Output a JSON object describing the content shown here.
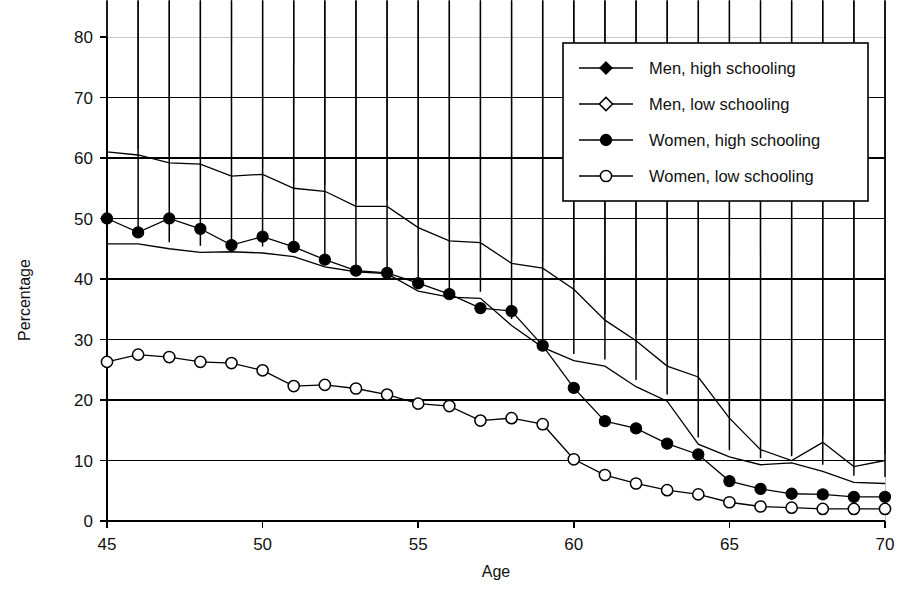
{
  "chart_data": {
    "type": "line",
    "title": "",
    "xlabel": "Age",
    "ylabel": "Percentage",
    "xlim": [
      45,
      70
    ],
    "ylim": [
      0,
      80
    ],
    "xticks": [
      45,
      50,
      55,
      60,
      65,
      70
    ],
    "yticks": [
      0,
      10,
      20,
      30,
      40,
      50,
      60,
      70,
      80
    ],
    "grid": "horizontal",
    "legend_position": "top-right",
    "x": [
      45,
      46,
      47,
      48,
      49,
      50,
      51,
      52,
      53,
      54,
      55,
      56,
      57,
      58,
      59,
      60,
      61,
      62,
      63,
      64,
      65,
      66,
      67,
      68,
      69,
      70
    ],
    "series": [
      {
        "name": "Men, high schooling",
        "marker": "filled-diamond",
        "values": [
          61,
          60.5,
          59.2,
          59,
          57,
          57.3,
          55,
          54.5,
          52,
          52,
          48.5,
          46.3,
          46,
          42.6,
          41.8,
          38.3,
          33.2,
          29.8,
          25.6,
          23.8,
          17,
          11.8,
          10,
          13,
          9,
          10
        ]
      },
      {
        "name": "Men, low schooling",
        "marker": "open-diamond",
        "values": [
          45.8,
          45.8,
          45,
          44.4,
          44.5,
          44.3,
          43.7,
          42,
          41.2,
          40.9,
          38,
          37,
          36.8,
          32.3,
          28.7,
          26.5,
          25.6,
          22.2,
          19.8,
          12.7,
          10.6,
          9.3,
          9.6,
          8.2,
          6.4,
          6.2
        ]
      },
      {
        "name": "Women, high schooling",
        "marker": "filled-circle",
        "values": [
          50,
          47.7,
          50,
          48.3,
          45.6,
          47,
          45.3,
          43.2,
          41.4,
          41,
          39.3,
          37.5,
          35.2,
          34.7,
          29,
          22,
          16.5,
          15.3,
          12.8,
          11,
          6.6,
          5.3,
          4.5,
          4.4,
          4,
          4
        ]
      },
      {
        "name": "Women, low schooling",
        "marker": "open-circle",
        "values": [
          26.3,
          27.5,
          27.1,
          26.3,
          26.1,
          24.9,
          22.3,
          22.5,
          21.9,
          20.9,
          19.4,
          19,
          16.6,
          17,
          16,
          10.2,
          7.6,
          6.2,
          5.1,
          4.4,
          3.1,
          2.4,
          2.2,
          2,
          2,
          2
        ]
      }
    ]
  },
  "axes": {
    "y_label": "Percentage",
    "x_label": "Age",
    "y_tick_labels": [
      "0",
      "10",
      "20",
      "30",
      "40",
      "50",
      "60",
      "70",
      "80"
    ],
    "x_tick_labels": [
      "45",
      "50",
      "55",
      "60",
      "65",
      "70"
    ]
  },
  "legend": {
    "items": [
      {
        "label": "Men, high schooling",
        "marker": "filled-diamond"
      },
      {
        "label": "Men, low schooling",
        "marker": "open-diamond"
      },
      {
        "label": "Women, high schooling",
        "marker": "filled-circle"
      },
      {
        "label": "Women, low schooling",
        "marker": "open-circle"
      }
    ]
  },
  "colors": {
    "ink": "#000000",
    "background": "#ffffff",
    "grid": "#000000",
    "faint_grid": "#c9c9c9"
  }
}
